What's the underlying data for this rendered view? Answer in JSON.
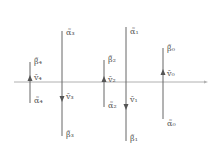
{
  "diagram": {
    "axis": {
      "y": 82,
      "x_start": 14,
      "x_end": 205,
      "color": "#b0b0b0"
    },
    "line_color": "#666666",
    "arrow_color": "#555555",
    "label_color": "#555555",
    "lines": [
      {
        "id": "4",
        "x": 30,
        "y_top": 62,
        "y_bottom": 103,
        "arrow": "up",
        "arrow_y": 79,
        "top_label": "β̃₄",
        "mid_label": "ṽ₄",
        "bottom_label": "α̃₄",
        "top_label_y": 58,
        "mid_label_y": 74,
        "bottom_label_y": 97
      },
      {
        "id": "3",
        "x": 62,
        "y_top": 31,
        "y_bottom": 136,
        "arrow": "down",
        "arrow_y": 98,
        "top_label": "α̃₃",
        "mid_label": "ṽ₃",
        "bottom_label": "β̃₃",
        "top_label_y": 29,
        "mid_label_y": 93,
        "bottom_label_y": 131
      },
      {
        "id": "2",
        "x": 104,
        "y_top": 60,
        "y_bottom": 107,
        "arrow": "up",
        "arrow_y": 80,
        "top_label": "β̃₂",
        "mid_label": "ṽ₂",
        "bottom_label": "α̃₂",
        "top_label_y": 56,
        "mid_label_y": 76,
        "bottom_label_y": 102
      },
      {
        "id": "1",
        "x": 126,
        "y_top": 27,
        "y_bottom": 141,
        "arrow": "down",
        "arrow_y": 106,
        "top_label": "α̃₁",
        "mid_label": "ṽ₁",
        "bottom_label": "β̃₁",
        "top_label_y": 28,
        "mid_label_y": 96,
        "bottom_label_y": 135
      },
      {
        "id": "0",
        "x": 163,
        "y_top": 48,
        "y_bottom": 119,
        "arrow": "up",
        "arrow_y": 73,
        "top_label": "β̃₀",
        "mid_label": "ṽ₀",
        "bottom_label": "α̃₀",
        "top_label_y": 45,
        "mid_label_y": 70,
        "bottom_label_y": 120
      }
    ]
  }
}
